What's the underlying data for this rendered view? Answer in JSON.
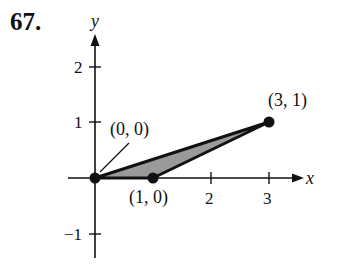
{
  "problem_number": "67.",
  "axes": {
    "x_label": "x",
    "y_label": "y",
    "x_ticks": [
      "2",
      "3"
    ],
    "y_ticks": [
      "2",
      "1",
      "−1"
    ]
  },
  "points": [
    {
      "label": "(0, 0)",
      "x": 0,
      "y": 0
    },
    {
      "label": "(1, 0)",
      "x": 1,
      "y": 0
    },
    {
      "label": "(3, 1)",
      "x": 3,
      "y": 1
    }
  ],
  "region": {
    "vertices": [
      [
        0,
        0
      ],
      [
        1,
        0
      ],
      [
        3,
        1
      ]
    ],
    "fill": "#9a9a9a"
  }
}
